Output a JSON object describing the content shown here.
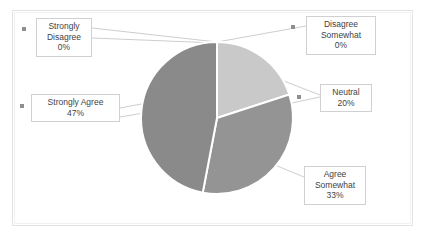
{
  "chart_data": {
    "type": "pie",
    "title": "",
    "categories": [
      "Strongly Disagree",
      "Disagree Somewhat",
      "Neutral",
      "Agree Somewhat",
      "Strongly Agree"
    ],
    "values": [
      0,
      0,
      20,
      33,
      47
    ],
    "value_labels": [
      "0%",
      "0%",
      "20%",
      "33%",
      "47%"
    ],
    "slice_colors": [
      "#c9c9c9",
      "#bdbdbd",
      "#c9c9c9",
      "#949494",
      "#8a8a8a"
    ],
    "legend_position": "none",
    "grid": false,
    "labels": [
      {
        "name": "strongly-disagree",
        "lines": [
          "Strongly",
          "Disagree",
          "0%"
        ],
        "marker": true
      },
      {
        "name": "disagree-somewhat",
        "lines": [
          "Disagree",
          "Somewhat",
          "0%"
        ],
        "marker": true
      },
      {
        "name": "neutral",
        "lines": [
          "Neutral",
          "20%"
        ],
        "marker": true
      },
      {
        "name": "agree-somewhat",
        "lines": [
          "Agree",
          "Somewhat",
          "33%"
        ],
        "marker": false
      },
      {
        "name": "strongly-agree",
        "lines": [
          "Strongly Agree",
          "47%"
        ],
        "marker": true
      }
    ]
  },
  "labels": {
    "strongly_disagree": {
      "line1": "Strongly",
      "line2": "Disagree",
      "line3": "0%"
    },
    "disagree_somewhat": {
      "line1": "Disagree",
      "line2": "Somewhat",
      "line3": "0%"
    },
    "neutral": {
      "line1": "Neutral",
      "line2": "20%"
    },
    "agree_somewhat": {
      "line1": "Agree",
      "line2": "Somewhat",
      "line3": "33%"
    },
    "strongly_agree": {
      "line1": "Strongly Agree",
      "line2": "47%"
    }
  },
  "colors": {
    "neutral_slice": "#c9c9c9",
    "agree_somewhat_slice": "#949494",
    "strongly_agree_slice": "#8a8a8a",
    "slice_outline": "#ffffff",
    "leader_line": "#b8b8b8",
    "label_border": "#d0d0d0",
    "frame_border": "#e3e3e3",
    "text": "#3f3f3f",
    "marker": "#8f8f8f"
  }
}
